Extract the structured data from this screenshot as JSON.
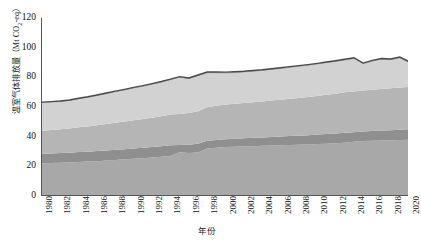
{
  "chart_data": {
    "type": "area",
    "title": "",
    "xlabel": "年份",
    "ylabel": "温室气体排放量（Mt CO2-eq）",
    "ylabel_prefix": "温室气体排放量（Mt CO",
    "ylabel_sub": "2",
    "ylabel_suffix": "-eq）",
    "xlim": [
      1980,
      2020
    ],
    "ylim": [
      0,
      120
    ],
    "yticks": [
      0,
      20,
      40,
      60,
      80,
      100,
      120
    ],
    "xticks": [
      1980,
      1982,
      1984,
      1986,
      1988,
      1990,
      1992,
      1994,
      1996,
      1998,
      2000,
      2002,
      2004,
      2006,
      2008,
      2010,
      2012,
      2014,
      2016,
      2018,
      2020
    ],
    "grid": false,
    "legend": "none",
    "stacked": true,
    "x": [
      1980,
      1981,
      1982,
      1983,
      1984,
      1985,
      1986,
      1987,
      1988,
      1989,
      1990,
      1991,
      1992,
      1993,
      1994,
      1995,
      1996,
      1997,
      1998,
      1999,
      2000,
      2001,
      2002,
      2003,
      2004,
      2005,
      2006,
      2007,
      2008,
      2009,
      2010,
      2011,
      2012,
      2013,
      2014,
      2015,
      2016,
      2017,
      2018,
      2019,
      2020
    ],
    "series": [
      {
        "name": "series-1",
        "color": "#a8a8a8",
        "values": [
          22.0,
          22.2,
          22.4,
          22.6,
          22.9,
          23.2,
          23.5,
          23.9,
          24.3,
          24.7,
          25.1,
          25.5,
          25.9,
          26.4,
          27.0,
          29.5,
          29.0,
          29.4,
          32.0,
          32.6,
          33.0,
          33.2,
          33.4,
          33.6,
          33.8,
          34.0,
          34.2,
          34.4,
          34.6,
          34.8,
          35.0,
          35.3,
          35.6,
          35.9,
          36.6,
          37.0,
          37.2,
          37.4,
          37.6,
          37.8,
          38.0
        ]
      },
      {
        "name": "series-2",
        "color": "#8f8f8f",
        "values": [
          6.5,
          6.5,
          6.6,
          6.6,
          6.7,
          6.7,
          6.8,
          6.8,
          6.9,
          6.9,
          7.0,
          7.0,
          7.1,
          7.1,
          7.2,
          4.8,
          5.6,
          5.8,
          5.2,
          5.2,
          5.3,
          5.4,
          5.5,
          5.6,
          5.7,
          5.8,
          5.9,
          6.0,
          6.1,
          6.2,
          6.4,
          6.5,
          6.6,
          6.8,
          6.4,
          6.5,
          6.6,
          6.7,
          6.8,
          6.9,
          7.0
        ]
      },
      {
        "name": "series-3",
        "color": "#b5b5b5",
        "values": [
          15.5,
          15.8,
          16.0,
          16.3,
          16.7,
          17.0,
          17.4,
          17.8,
          18.2,
          18.6,
          19.0,
          19.4,
          19.8,
          20.3,
          20.8,
          21.0,
          21.4,
          22.0,
          22.6,
          23.0,
          23.4,
          23.6,
          23.8,
          24.0,
          24.2,
          24.5,
          24.8,
          25.1,
          25.4,
          25.7,
          26.0,
          26.4,
          26.8,
          27.2,
          27.4,
          27.6,
          27.8,
          28.0,
          28.2,
          28.4,
          28.6
        ]
      },
      {
        "name": "series-4",
        "color": "#d2d2d2",
        "values": [
          18.5,
          18.3,
          18.2,
          18.4,
          18.8,
          19.2,
          19.6,
          20.0,
          20.4,
          20.8,
          21.2,
          21.6,
          22.0,
          22.4,
          22.8,
          24.2,
          22.6,
          23.4,
          22.8,
          21.8,
          20.8,
          20.6,
          20.4,
          20.4,
          20.4,
          20.5,
          20.6,
          20.7,
          20.8,
          20.9,
          21.0,
          21.1,
          21.2,
          21.3,
          21.8,
          17.5,
          18.8,
          19.6,
          18.8,
          19.6,
          16.0
        ]
      },
      {
        "name": "series-5",
        "color": "#b0b0b0",
        "values": [
          0.8,
          0.8,
          0.8,
          0.8,
          0.8,
          0.8,
          0.8,
          0.9,
          0.9,
          0.9,
          0.9,
          0.9,
          1.0,
          1.0,
          1.0,
          1.0,
          1.0,
          1.0,
          1.0,
          1.0,
          1.0,
          1.0,
          1.0,
          1.0,
          1.0,
          1.0,
          1.0,
          1.0,
          1.0,
          1.0,
          1.0,
          1.0,
          1.0,
          1.0,
          1.0,
          1.0,
          1.0,
          1.0,
          1.0,
          1.0,
          1.0
        ]
      }
    ],
    "total_line": {
      "name": "total-emissions-line",
      "color": "#4a4a4a",
      "values": [
        63.3,
        63.6,
        64.0,
        64.7,
        65.9,
        66.9,
        68.1,
        69.4,
        70.7,
        71.9,
        73.2,
        74.4,
        75.8,
        77.2,
        78.8,
        80.5,
        79.6,
        81.6,
        83.6,
        83.6,
        83.5,
        83.8,
        84.1,
        84.6,
        85.1,
        85.8,
        86.5,
        87.2,
        87.9,
        88.6,
        89.4,
        90.3,
        91.2,
        92.2,
        93.2,
        89.6,
        91.4,
        92.7,
        92.4,
        93.7,
        90.6
      ]
    }
  },
  "axis": {
    "x_title": "年份",
    "y_tick_labels": [
      "120",
      "100",
      "80",
      "60",
      "40",
      "20",
      "0"
    ],
    "x_tick_labels": [
      "1980",
      "1982",
      "1984",
      "1986",
      "1988",
      "1990",
      "1992",
      "1994",
      "1996",
      "1998",
      "2000",
      "2002",
      "2004",
      "2006",
      "2008",
      "2010",
      "2012",
      "2014",
      "2016",
      "2018",
      "2020"
    ]
  },
  "caption": {
    "text": ""
  },
  "colors": {
    "axis": "#555555",
    "text": "#111111",
    "background": "#ffffff"
  }
}
